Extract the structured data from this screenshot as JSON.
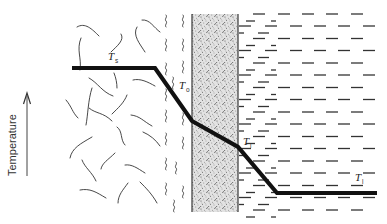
{
  "diagram": {
    "axis": {
      "label": "Temperature",
      "direction": "up"
    },
    "labels": [
      {
        "id": "Ts",
        "symbol": "T",
        "subscript": "s",
        "x": 109,
        "y": 60
      },
      {
        "id": "To",
        "symbol": "T",
        "subscript": "o",
        "x": 179,
        "y": 90
      },
      {
        "id": "Ti",
        "symbol": "T",
        "subscript": "i",
        "x": 243,
        "y": 146
      },
      {
        "id": "Tl",
        "symbol": "T",
        "subscript": "l",
        "x": 355,
        "y": 181
      }
    ],
    "regions": [
      {
        "name": "gas-bulk",
        "pattern": "large squiggles",
        "x_from": 60,
        "x_to": 160
      },
      {
        "name": "gas-film",
        "pattern": "small squiggles",
        "x_from": 160,
        "x_to": 192
      },
      {
        "name": "solid-wall",
        "pattern": "stipple",
        "x_from": 192,
        "x_to": 238
      },
      {
        "name": "liquid",
        "pattern": "dashes",
        "x_from": 238,
        "x_to": 387
      }
    ],
    "profile_points": [
      [
        72,
        68
      ],
      [
        155,
        68
      ],
      [
        192,
        121
      ],
      [
        238,
        147
      ],
      [
        277,
        193
      ],
      [
        377,
        193
      ]
    ],
    "colors": {
      "line": "#111111",
      "wall_fill": "#d6d6d6",
      "background": "#ffffff"
    }
  }
}
